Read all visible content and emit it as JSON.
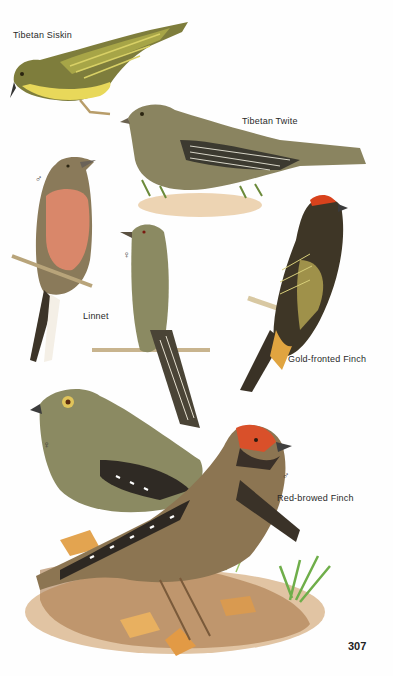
{
  "plate": {
    "page_number": "307",
    "species": [
      {
        "name": "Tibetan Siskin",
        "sex_marks": []
      },
      {
        "name": "Tibetan Twite",
        "sex_marks": []
      },
      {
        "name": "Linnet",
        "sex_marks": [
          "♂",
          "♀"
        ]
      },
      {
        "name": "Gold-fronted Finch",
        "sex_marks": []
      },
      {
        "name": "Red-browed Finch",
        "sex_marks": [
          "♀",
          "♂"
        ]
      }
    ]
  },
  "labels": {
    "tibetan_siskin": "Tibetan Siskin",
    "tibetan_twite": "Tibetan Twite",
    "linnet": "Linnet",
    "gold_fronted_finch": "Gold-fronted Finch",
    "red_browed_finch": "Red-browed Finch"
  },
  "sex_marks": {
    "linnet_male": "♂",
    "linnet_female": "♀",
    "red_browed_female": "♀",
    "red_browed_male": "♂"
  },
  "colors": {
    "siskin_yellow": "#e6d45a",
    "siskin_olive": "#7b7a3a",
    "twite_brown": "#8a7f5c",
    "linnet_breast": "#d88a6a",
    "gold_fronted_crown": "#d8421c",
    "gold_fronted_body": "#3e3626",
    "red_browed_face": "#d9502a",
    "red_browed_body": "#8c7552",
    "female_olive": "#8b8a62",
    "leaf_litter": "#d9a055",
    "grass_green": "#6fae4a"
  }
}
